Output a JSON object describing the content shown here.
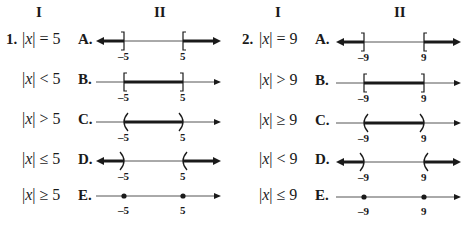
{
  "problems": [
    {
      "number": "1.",
      "column_headers": {
        "left": "I",
        "right": "II"
      },
      "left_value": "-5",
      "right_value": "5",
      "rows": [
        {
          "inequality_prefix": "|x|",
          "relation": "=",
          "value": "5",
          "letter": "A."
        },
        {
          "inequality_prefix": "|x|",
          "relation": "<",
          "value": "5",
          "letter": "B."
        },
        {
          "inequality_prefix": "|x|",
          "relation": ">",
          "value": "5",
          "letter": "C."
        },
        {
          "inequality_prefix": "|x|",
          "relation": "≤",
          "value": "5",
          "letter": "D."
        },
        {
          "inequality_prefix": "|x|",
          "relation": "≥",
          "value": "5",
          "letter": "E."
        }
      ],
      "graphs": [
        {
          "letter": "A",
          "description": "rays outward from -5 and 5 with brackets",
          "tick_left": "-5",
          "tick_right": "5"
        },
        {
          "letter": "B",
          "description": "segment between -5 and 5 with brackets",
          "tick_left": "-5",
          "tick_right": "5"
        },
        {
          "letter": "C",
          "description": "segment between -5 and 5 with parentheses",
          "tick_left": "-5",
          "tick_right": "5"
        },
        {
          "letter": "D",
          "description": "rays outward from -5 and 5 with parentheses",
          "tick_left": "-5",
          "tick_right": "5"
        },
        {
          "letter": "E",
          "description": "two dots at -5 and 5",
          "tick_left": "-5",
          "tick_right": "5"
        }
      ]
    },
    {
      "number": "2.",
      "column_headers": {
        "left": "I",
        "right": "II"
      },
      "left_value": "-9",
      "right_value": "9",
      "rows": [
        {
          "inequality_prefix": "|x|",
          "relation": "=",
          "value": "9",
          "letter": "A."
        },
        {
          "inequality_prefix": "|x|",
          "relation": ">",
          "value": "9",
          "letter": "B."
        },
        {
          "inequality_prefix": "|x|",
          "relation": "≥",
          "value": "9",
          "letter": "C."
        },
        {
          "inequality_prefix": "|x|",
          "relation": "<",
          "value": "9",
          "letter": "D."
        },
        {
          "inequality_prefix": "|x|",
          "relation": "≤",
          "value": "9",
          "letter": "E."
        }
      ],
      "graphs": [
        {
          "letter": "A",
          "description": "rays outward from -9 and 9 with brackets",
          "tick_left": "-9",
          "tick_right": "9"
        },
        {
          "letter": "B",
          "description": "segment between -9 and 9 with brackets",
          "tick_left": "-9",
          "tick_right": "9"
        },
        {
          "letter": "C",
          "description": "segment between -9 and 9 with parentheses",
          "tick_left": "-9",
          "tick_right": "9"
        },
        {
          "letter": "D",
          "description": "rays outward from -9 and 9 with parentheses",
          "tick_left": "-9",
          "tick_right": "9"
        },
        {
          "letter": "E",
          "description": "two dots at -9 and 9",
          "tick_left": "-9",
          "tick_right": "9"
        }
      ]
    }
  ],
  "ticks": {
    "p1_left": "–5",
    "p1_right": "5",
    "p2_left": "–9",
    "p2_right": "9"
  },
  "colors": {
    "ink": "#1a1a1a",
    "line": "#444444",
    "background": "#ffffff"
  }
}
